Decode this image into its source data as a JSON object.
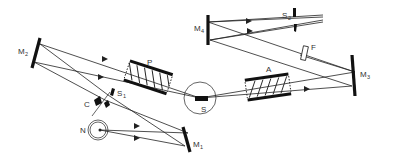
{
  "diagram": {
    "labels": {
      "M1": {
        "main": "M",
        "sub": "1"
      },
      "M2": {
        "main": "M",
        "sub": "2"
      },
      "M3": {
        "main": "M",
        "sub": "3"
      },
      "M4": {
        "main": "M",
        "sub": "4"
      },
      "S1": {
        "main": "S",
        "sub": "1"
      },
      "S2": {
        "main": "S",
        "sub": "2"
      },
      "P": "P",
      "A": "A",
      "S": "S",
      "F": "F",
      "C": "C",
      "N": "N"
    },
    "colors": {
      "line": "#222222",
      "background": "#ffffff"
    }
  }
}
